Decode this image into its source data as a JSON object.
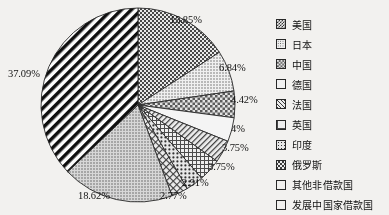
{
  "chart_data": {
    "type": "pie",
    "title": "",
    "xlabel": "",
    "ylabel": "",
    "legend_position": "right",
    "grid": false,
    "categories": [
      "美国",
      "日本",
      "中国",
      "德国",
      "法国",
      "英国",
      "印度",
      "俄罗斯",
      "其他非借款国",
      "发展中国家借款国"
    ],
    "values": [
      15.85,
      6.84,
      4.42,
      4,
      3.75,
      3.75,
      2.91,
      2.77,
      18.62,
      37.09
    ],
    "value_labels": [
      "15.85%",
      "6.84%",
      "4.42%",
      "4%",
      "3.75%",
      "3.75%",
      "2.91%",
      "2.77%",
      "18.62%",
      "37.09%"
    ],
    "units": "percent",
    "patterns": [
      "checker-dense",
      "dots-fine",
      "checker-mid",
      "plain",
      "diag-fine",
      "grid",
      "dots-coarse",
      "cross",
      "gray-texture",
      "bold-diagonal"
    ]
  },
  "pie": {
    "slices": [
      {
        "label": "美国",
        "value": 15.85,
        "value_label": "15.85%",
        "pattern": "checker-dense",
        "label_x": 170,
        "label_y": 14
      },
      {
        "label": "日本",
        "value": 6.84,
        "value_label": "6.84%",
        "pattern": "dots-fine",
        "label_x": 219,
        "label_y": 62
      },
      {
        "label": "中国",
        "value": 4.42,
        "value_label": "4.42%",
        "pattern": "checker-mid",
        "label_x": 231,
        "label_y": 94
      },
      {
        "label": "德国",
        "value": 4,
        "value_label": "4%",
        "pattern": "plain",
        "label_x": 231,
        "label_y": 123
      },
      {
        "label": "法国",
        "value": 3.75,
        "value_label": "3.75%",
        "pattern": "diag-fine",
        "label_x": 222,
        "label_y": 142
      },
      {
        "label": "英国",
        "value": 3.75,
        "value_label": "3.75%",
        "pattern": "grid",
        "label_x": 208,
        "label_y": 161
      },
      {
        "label": "印度",
        "value": 2.91,
        "value_label": "2.91%",
        "pattern": "dots-coarse",
        "label_x": 182,
        "label_y": 177
      },
      {
        "label": "俄罗斯",
        "value": 2.77,
        "value_label": "2.77%",
        "pattern": "cross",
        "label_x": 160,
        "label_y": 190
      },
      {
        "label": "其他非借款国",
        "value": 18.62,
        "value_label": "18.62%",
        "pattern": "gray-texture",
        "label_x": 78,
        "label_y": 190
      },
      {
        "label": "发展中国家借款国",
        "value": 37.09,
        "value_label": "37.09%",
        "pattern": "bold-diagonal",
        "label_x": 8,
        "label_y": 68
      }
    ]
  },
  "legend": {
    "items": [
      {
        "label": "美国",
        "pattern": "checker-dense"
      },
      {
        "label": "日本",
        "pattern": "dots-fine"
      },
      {
        "label": "中国",
        "pattern": "checker-mid"
      },
      {
        "label": "德国",
        "pattern": "plain"
      },
      {
        "label": "法国",
        "pattern": "diag-fine"
      },
      {
        "label": "英国",
        "pattern": "grid"
      },
      {
        "label": "印度",
        "pattern": "dots-coarse"
      },
      {
        "label": "俄罗斯",
        "pattern": "cross"
      },
      {
        "label": "其他非借款国",
        "pattern": "gray-texture"
      },
      {
        "label": "发展中国家借款国",
        "pattern": "bold-diagonal"
      }
    ]
  },
  "colors": {
    "background": "#f2f1ef",
    "ink": "#161616",
    "outline": "#2a2a2a"
  }
}
